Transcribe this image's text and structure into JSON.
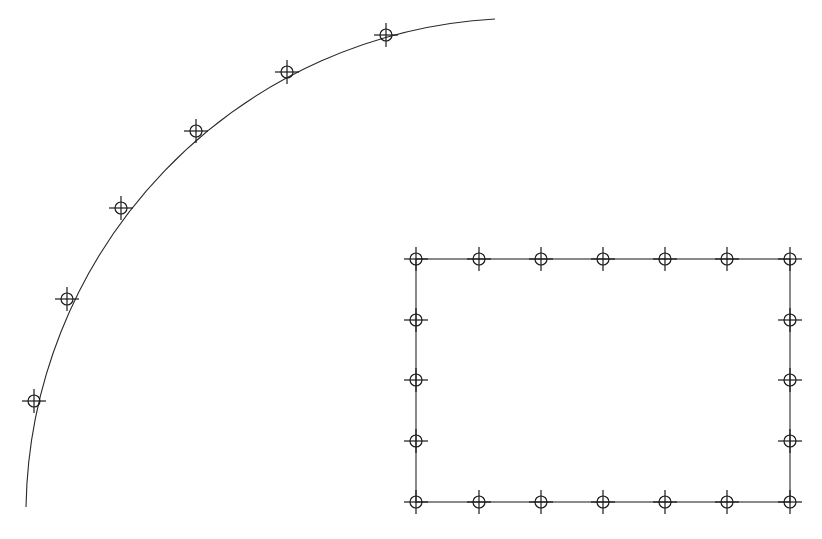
{
  "canvas": {
    "width": 822,
    "height": 539,
    "background": "#ffffff",
    "stroke_color": "#2a2a2a"
  },
  "marker_style": {
    "circle_radius": 6,
    "cross_arm": 12
  },
  "arc": {
    "center": [
      522,
      515
    ],
    "radius": 497,
    "start": [
      26,
      507
    ],
    "end": [
      495,
      19
    ],
    "markers": [
      [
        34,
        401
      ],
      [
        67,
        299
      ],
      [
        121,
        208
      ],
      [
        196,
        131
      ],
      [
        287,
        72
      ],
      [
        386,
        35
      ]
    ]
  },
  "rectangle": {
    "x": 416,
    "y": 259,
    "width": 374,
    "height": 243,
    "markers": [
      [
        416,
        259
      ],
      [
        479,
        259
      ],
      [
        541,
        259
      ],
      [
        603,
        259
      ],
      [
        665,
        259
      ],
      [
        727,
        259
      ],
      [
        790,
        259
      ],
      [
        416,
        320
      ],
      [
        416,
        380
      ],
      [
        416,
        441
      ],
      [
        790,
        320
      ],
      [
        790,
        380
      ],
      [
        790,
        441
      ],
      [
        416,
        502
      ],
      [
        479,
        502
      ],
      [
        541,
        502
      ],
      [
        603,
        502
      ],
      [
        665,
        502
      ],
      [
        727,
        502
      ],
      [
        790,
        502
      ]
    ]
  }
}
